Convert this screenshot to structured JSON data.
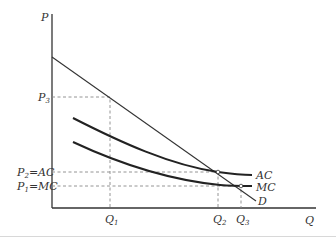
{
  "diagram": {
    "axes": {
      "y_label": "P",
      "x_label": "Q"
    },
    "curves": [
      {
        "id": "demand",
        "label": "D"
      },
      {
        "id": "average-cost",
        "label": "AC"
      },
      {
        "id": "marginal-cost",
        "label": "MC"
      }
    ],
    "price_labels": {
      "p3": {
        "main": "P",
        "sub": "3",
        "suffix": ""
      },
      "p2": {
        "main": "P",
        "sub": "2",
        "suffix": "=AC"
      },
      "p1": {
        "main": "P",
        "sub": "1",
        "suffix": "=MC"
      }
    },
    "quantity_labels": {
      "q1": {
        "main": "Q",
        "sub": "1"
      },
      "q2": {
        "main": "Q",
        "sub": "2"
      },
      "q3": {
        "main": "Q",
        "sub": "3"
      }
    }
  }
}
